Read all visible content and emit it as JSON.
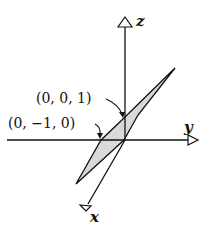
{
  "diagram": {
    "type": "3d-coordinate-axes-with-plane",
    "axes": [
      {
        "name": "z",
        "label": "z"
      },
      {
        "name": "y",
        "label": "y"
      },
      {
        "name": "x",
        "label": "x"
      }
    ],
    "points": [
      {
        "label": "(0, 0, 1)"
      },
      {
        "label": "(0, −1, 0)"
      }
    ],
    "plane": {
      "fill": "#d9d9d9",
      "stroke": "#111111"
    },
    "colors": {
      "ink": "#111111",
      "background": "#ffffff",
      "plane_fill": "#d9d9d9"
    }
  }
}
